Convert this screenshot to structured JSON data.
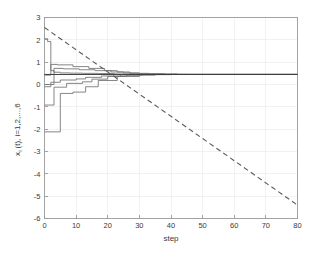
{
  "chart_data": {
    "type": "line",
    "title": "",
    "xlabel": "step",
    "ylabel_main": "x (t), i=1,2,...,6",
    "ylabel_parts": {
      "prefix": "x",
      "subscript": "i",
      "middle": "(t), i=1,2,...,6"
    },
    "xlim": [
      0,
      80
    ],
    "ylim": [
      -6,
      3
    ],
    "xticks": [
      0,
      10,
      20,
      30,
      40,
      50,
      60,
      70,
      80
    ],
    "xtick_labels": [
      "0",
      "10",
      "20",
      "30",
      "40",
      "50",
      "60",
      "70",
      "80"
    ],
    "yticks": [
      3,
      2,
      1,
      0,
      -1,
      -2,
      -3,
      -4,
      -5,
      -6
    ],
    "ytick_labels": [
      "3",
      "2",
      "1",
      "0",
      "-1",
      "-2",
      "-3",
      "-4",
      "-5",
      "-6"
    ],
    "grid": true,
    "legend": "none",
    "consensus_value": 0.45,
    "series": [
      {
        "name": "x1(t)",
        "style": "solid",
        "color": "#6f6f6f",
        "x": [
          0,
          1,
          1,
          2,
          2,
          3,
          3,
          5,
          5,
          8,
          8,
          12,
          12,
          17,
          17,
          22,
          22,
          28,
          28,
          34,
          34,
          45,
          45,
          80
        ],
        "values": [
          2.05,
          2.05,
          1.92,
          1.92,
          0.62,
          0.62,
          0.55,
          0.55,
          0.52,
          0.52,
          0.51,
          0.51,
          0.5,
          0.5,
          0.49,
          0.49,
          0.47,
          0.47,
          0.46,
          0.46,
          0.455,
          0.455,
          0.45,
          0.45
        ]
      },
      {
        "name": "x2(t)",
        "style": "solid",
        "color": "#6f6f6f",
        "x": [
          0,
          2,
          2,
          4,
          4,
          9,
          9,
          14,
          14,
          19,
          19,
          23,
          23,
          27,
          27,
          33,
          33,
          42,
          42,
          80
        ],
        "values": [
          0.42,
          0.42,
          0.9,
          0.9,
          0.88,
          0.88,
          0.8,
          0.8,
          0.72,
          0.72,
          0.62,
          0.62,
          0.56,
          0.56,
          0.5,
          0.5,
          0.47,
          0.47,
          0.45,
          0.45
        ]
      },
      {
        "name": "x3(t)",
        "style": "solid",
        "color": "#6f6f6f",
        "x": [
          0,
          3,
          3,
          6,
          6,
          11,
          11,
          16,
          16,
          21,
          21,
          25,
          25,
          30,
          30,
          38,
          38,
          80
        ],
        "values": [
          0.0,
          0.0,
          0.72,
          0.72,
          0.7,
          0.7,
          0.66,
          0.66,
          0.62,
          0.62,
          0.56,
          0.56,
          0.52,
          0.52,
          0.48,
          0.48,
          0.45,
          0.45
        ]
      },
      {
        "name": "x4(t)",
        "style": "solid",
        "color": "#6f6f6f",
        "x": [
          0,
          2,
          2,
          5,
          5,
          10,
          10,
          13,
          13,
          18,
          18,
          24,
          24,
          31,
          31,
          40,
          40,
          80
        ],
        "values": [
          -0.1,
          -0.1,
          0.1,
          0.1,
          0.2,
          0.2,
          0.25,
          0.25,
          0.32,
          0.32,
          0.38,
          0.38,
          0.42,
          0.42,
          0.44,
          0.44,
          0.45,
          0.45
        ]
      },
      {
        "name": "x5(t)",
        "style": "solid",
        "color": "#6f6f6f",
        "x": [
          0,
          3,
          3,
          7,
          7,
          12,
          12,
          15,
          15,
          20,
          20,
          26,
          26,
          35,
          35,
          80
        ],
        "values": [
          -0.92,
          -0.92,
          -0.12,
          -0.12,
          0.05,
          0.05,
          0.12,
          0.12,
          0.24,
          0.24,
          0.36,
          0.36,
          0.42,
          0.42,
          0.45,
          0.45
        ]
      },
      {
        "name": "x6(t)",
        "style": "solid",
        "color": "#6f6f6f",
        "x": [
          0,
          5,
          5,
          9,
          9,
          13,
          13,
          17,
          17,
          23,
          23,
          30,
          30,
          80
        ],
        "values": [
          -2.12,
          -2.12,
          -0.4,
          -0.4,
          -0.34,
          -0.34,
          -0.1,
          -0.1,
          0.18,
          0.18,
          0.36,
          0.36,
          0.45,
          0.45
        ]
      },
      {
        "name": "consensus-level",
        "style": "solid-dark",
        "color": "#3b3b3b",
        "x": [
          0,
          80
        ],
        "values": [
          0.45,
          0.45
        ]
      },
      {
        "name": "reference-dashed",
        "style": "dashed",
        "color": "#5a5a5a",
        "x": [
          0,
          80
        ],
        "values": [
          2.55,
          -5.4
        ]
      }
    ]
  }
}
